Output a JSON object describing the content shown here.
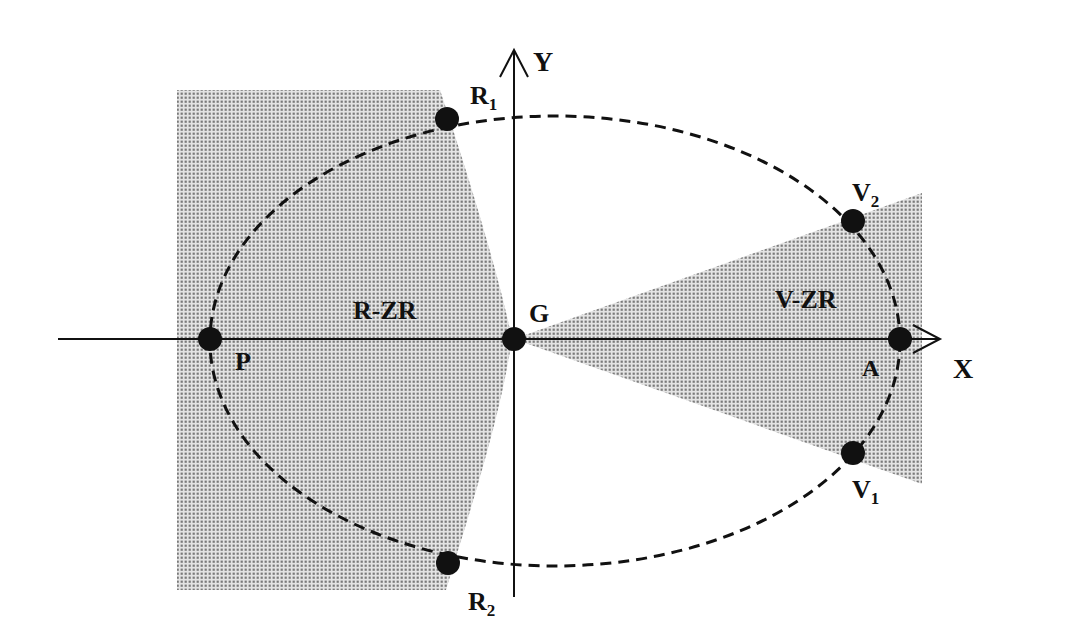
{
  "diagram": {
    "type": "ellipse-zone-diagram",
    "colors": {
      "background": "#ffffff",
      "ink": "#111111",
      "zone_fill": "#8a8a8a",
      "zone_bg": "#e2e2e2"
    },
    "axes": {
      "x_label": "X",
      "y_label": "Y"
    },
    "regions": {
      "r_zr": "R-ZR",
      "v_zr": "V-ZR"
    },
    "points": {
      "G": {
        "label": "G",
        "sub": ""
      },
      "P": {
        "label": "P",
        "sub": ""
      },
      "A": {
        "label": "A",
        "sub": ""
      },
      "R1": {
        "label": "R",
        "sub": "1"
      },
      "R2": {
        "label": "R",
        "sub": "2"
      },
      "V1": {
        "label": "V",
        "sub": "1"
      },
      "V2": {
        "label": "V",
        "sub": "2"
      }
    },
    "orbit": {
      "style": "dashed ellipse",
      "description": "Ellipse through P, R1, V2, A, V1, R2 with G at the origin"
    }
  }
}
